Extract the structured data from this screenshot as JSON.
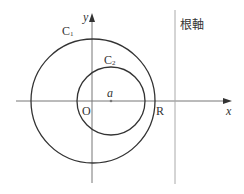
{
  "diagram": {
    "axis_x_label": "x",
    "axis_y_label": "y",
    "origin_label": "O",
    "circle1_label": "C",
    "circle1_sub": "1",
    "circle2_label": "C",
    "circle2_sub": "2",
    "point_label": "a",
    "intersection_label": "R",
    "radical_axis_label": "根軸",
    "colors": {
      "stroke": "#333333",
      "axis": "#777777",
      "radical_axis": "#aaaaaa"
    }
  }
}
